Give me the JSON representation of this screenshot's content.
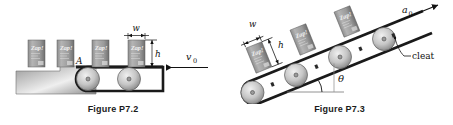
{
  "page": {
    "background_color": "#ffffff",
    "width": 453,
    "height": 125
  },
  "figures": [
    {
      "id": "P7.2",
      "caption": "Figure P7.2",
      "description": "Horizontal conveyor belt carrying upright boxes off a table",
      "labels": {
        "point_a": "A",
        "width": "w",
        "height": "h",
        "velocity": "v",
        "velocity_subscript": "0"
      },
      "boxes": [
        {
          "brand": "Zap!"
        },
        {
          "brand": "Zap!"
        },
        {
          "brand": "Zap!"
        },
        {
          "brand": "Zap!"
        }
      ],
      "pulley_count": 2,
      "colors": {
        "belt": "#1a1a1a",
        "box_fill_light": "#b9b9b9",
        "box_fill_dark": "#6e6e6e",
        "pulley_light": "#e2e2e2",
        "pulley_dark": "#8a8a8a",
        "platform_light": "#e8e8e8",
        "platform_dark": "#8f8f8f",
        "line": "#111111"
      }
    },
    {
      "id": "P7.3",
      "caption": "Figure P7.3",
      "description": "Inclined conveyor belt with cleats carrying boxes up a slope",
      "labels": {
        "width": "w",
        "height": "h",
        "angle": "θ",
        "cleat": "cleat",
        "acceleration": "a",
        "acceleration_subscript": "0"
      },
      "boxes": [
        {
          "brand": "Zap!"
        },
        {
          "brand": "Zap!"
        },
        {
          "brand": "Zap!"
        },
        {
          "brand": "Zap!"
        }
      ],
      "pulley_count": 4,
      "incline_angle_deg": 22,
      "colors": {
        "belt": "#1a1a1a",
        "box_fill_light": "#b9b9b9",
        "box_fill_dark": "#6e6e6e",
        "pulley_light": "#e2e2e2",
        "pulley_dark": "#8a8a8a",
        "line": "#111111"
      }
    }
  ]
}
